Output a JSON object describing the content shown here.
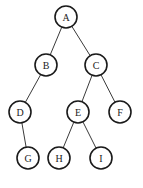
{
  "diagram": {
    "type": "binary-tree",
    "colors": {
      "background": "#ffffff",
      "stroke": "#1a1a1a",
      "text": "#222222"
    },
    "node_radius": 11,
    "nodes": [
      {
        "id": "A",
        "label": "A",
        "x": 66,
        "y": 17
      },
      {
        "id": "B",
        "label": "B",
        "x": 46,
        "y": 65
      },
      {
        "id": "C",
        "label": "C",
        "x": 96,
        "y": 65
      },
      {
        "id": "D",
        "label": "D",
        "x": 20,
        "y": 112
      },
      {
        "id": "E",
        "label": "E",
        "x": 78,
        "y": 112
      },
      {
        "id": "F",
        "label": "F",
        "x": 120,
        "y": 112
      },
      {
        "id": "G",
        "label": "G",
        "x": 28,
        "y": 158
      },
      {
        "id": "H",
        "label": "H",
        "x": 59,
        "y": 158
      },
      {
        "id": "I",
        "label": "I",
        "x": 101,
        "y": 158
      }
    ],
    "edges": [
      {
        "from": "A",
        "to": "B"
      },
      {
        "from": "A",
        "to": "C"
      },
      {
        "from": "B",
        "to": "D"
      },
      {
        "from": "C",
        "to": "E"
      },
      {
        "from": "C",
        "to": "F"
      },
      {
        "from": "D",
        "to": "G"
      },
      {
        "from": "E",
        "to": "H"
      },
      {
        "from": "E",
        "to": "I"
      }
    ]
  }
}
